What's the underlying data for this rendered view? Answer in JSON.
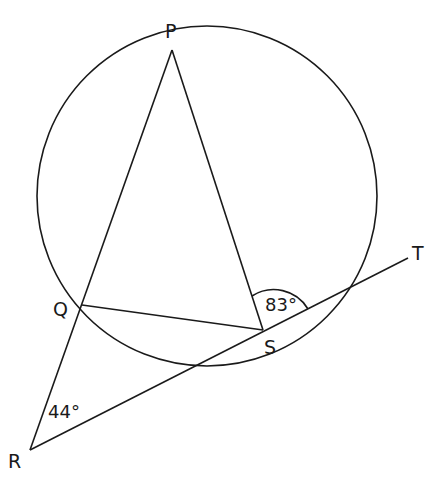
{
  "diagram": {
    "type": "circle-geometry",
    "points": {
      "P": {
        "label": "P",
        "x": 172,
        "y": 50
      },
      "Q": {
        "label": "Q",
        "x": 82,
        "y": 305
      },
      "S": {
        "label": "S",
        "x": 263,
        "y": 330
      },
      "R": {
        "label": "R",
        "x": 30,
        "y": 450
      },
      "T": {
        "label": "T",
        "x": 408,
        "y": 250
      }
    },
    "angles": {
      "angle_S": "83°",
      "angle_R": "44°"
    },
    "colors": {
      "stroke": "#1a1a1a",
      "background": "#ffffff"
    }
  }
}
